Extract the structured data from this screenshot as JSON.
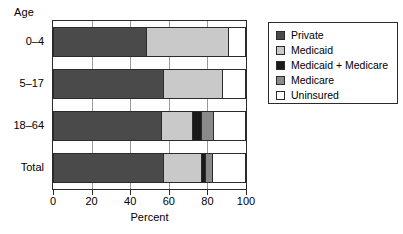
{
  "chart_data": {
    "type": "bar",
    "orientation": "horizontal",
    "stacked": true,
    "title": "",
    "xlabel": "Percent",
    "ylabel": "Age",
    "xlim": [
      0,
      100
    ],
    "xticks": [
      0,
      20,
      40,
      60,
      80,
      100
    ],
    "xticklabels": [
      "0",
      "20",
      "40",
      "60",
      "80",
      "100"
    ],
    "grid": true,
    "legend_position": "right",
    "categories": [
      "0–4",
      "5–17",
      "18–64",
      "Total"
    ],
    "series": [
      {
        "name": "Private",
        "color": "#4a4a4a",
        "values": [
          48,
          57,
          56,
          57
        ]
      },
      {
        "name": "Medicaid",
        "color": "#c9c9c9",
        "values": [
          43,
          31,
          16,
          20
        ]
      },
      {
        "name": "Medicaid + Medicare",
        "color": "#1a1a1a",
        "values": [
          0,
          0,
          5,
          2
        ]
      },
      {
        "name": "Medicare",
        "color": "#8a8a8a",
        "values": [
          0,
          0,
          6,
          4
        ]
      },
      {
        "name": "Uninsured",
        "color": "#ffffff",
        "values": [
          9,
          12,
          17,
          17
        ]
      }
    ],
    "legend_entries": [
      {
        "label": "Private",
        "color": "#4a4a4a"
      },
      {
        "label": "Medicaid",
        "color": "#c9c9c9"
      },
      {
        "label": "Medicaid + Medicare",
        "color": "#1a1a1a"
      },
      {
        "label": "Medicare",
        "color": "#8a8a8a"
      },
      {
        "label": "Uninsured",
        "color": "#ffffff"
      }
    ]
  },
  "axis": {
    "y_title": "Age",
    "x_title": "Percent"
  }
}
